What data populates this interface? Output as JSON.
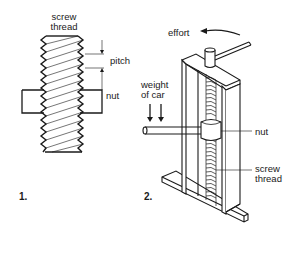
{
  "figure1": {
    "number": "1.",
    "labels": {
      "screw_thread_line1": "screw",
      "screw_thread_line2": "thread",
      "pitch": "pitch",
      "nut": "nut"
    }
  },
  "figure2": {
    "number": "2.",
    "labels": {
      "effort": "effort",
      "weight_line1": "weight",
      "weight_line2": "of car",
      "nut": "nut",
      "screw_thread_line1": "screw",
      "screw_thread_line2": "thread"
    }
  },
  "colors": {
    "line": "#1a1a1a",
    "background": "#ffffff"
  }
}
